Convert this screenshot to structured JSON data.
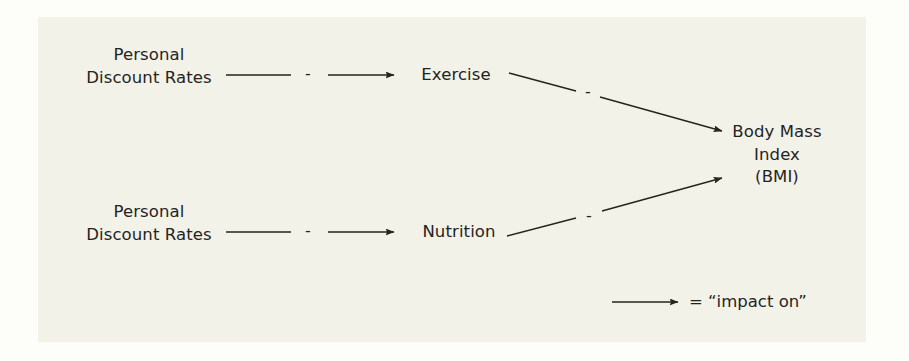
{
  "diagram": {
    "background_color": "#f2f2e8",
    "ink_color": "#24241f",
    "nodes": [
      {
        "id": "pdr-1",
        "label": "Personal\nDiscount Rates"
      },
      {
        "id": "pdr-2",
        "label": "Personal\nDiscount Rates"
      },
      {
        "id": "exercise",
        "label": "Exercise"
      },
      {
        "id": "nutrition",
        "label": "Nutrition"
      },
      {
        "id": "bmi",
        "label": "Body Mass\nIndex\n(BMI)"
      }
    ],
    "edges": [
      {
        "id": "edge-pdr1-exercise",
        "from": "pdr-1",
        "to": "exercise",
        "sign": "-"
      },
      {
        "id": "edge-pdr2-nutrition",
        "from": "pdr-2",
        "to": "nutrition",
        "sign": "-"
      },
      {
        "id": "edge-exercise-bmi",
        "from": "exercise",
        "to": "bmi",
        "sign": "-"
      },
      {
        "id": "edge-nutrition-bmi",
        "from": "nutrition",
        "to": "bmi",
        "sign": "-"
      }
    ],
    "legend": {
      "arrow_icon": "arrow-right-icon",
      "text": "= “impact on”"
    }
  }
}
